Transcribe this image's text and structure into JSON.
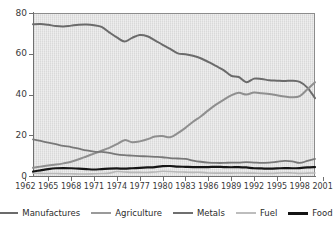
{
  "chart_data": {
    "type": "line",
    "title": "",
    "subtitle": "",
    "xlabel": "",
    "ylabel": "",
    "xlim": [
      1963,
      2000
    ],
    "ylim": [
      0,
      80
    ],
    "yticks": [
      0,
      20,
      40,
      60,
      80
    ],
    "xticks": [
      1962,
      1965,
      1968,
      1971,
      1974,
      1977,
      1980,
      1983,
      1986,
      1989,
      1992,
      1995,
      1998,
      2001
    ],
    "grid": false,
    "legend_position": "bottom",
    "x": [
      1963,
      1964,
      1965,
      1966,
      1967,
      1968,
      1969,
      1970,
      1971,
      1972,
      1973,
      1974,
      1975,
      1976,
      1977,
      1978,
      1979,
      1980,
      1981,
      1982,
      1983,
      1984,
      1985,
      1986,
      1987,
      1988,
      1989,
      1990,
      1991,
      1992,
      1993,
      1994,
      1995,
      1996,
      1997,
      1998,
      1999,
      2000
    ],
    "series": [
      {
        "name": "Manufactures",
        "color": "#6b6b6b",
        "width": 2.0,
        "values": [
          74.5,
          74.6,
          74.2,
          73.6,
          73.4,
          73.8,
          74.2,
          74.3,
          74.0,
          73.2,
          70.5,
          68.0,
          66.0,
          67.8,
          69.2,
          68.6,
          66.6,
          64.4,
          62.4,
          60.2,
          59.8,
          59.0,
          57.8,
          56.0,
          54.0,
          52.0,
          49.2,
          48.6,
          46.0,
          47.8,
          47.6,
          47.0,
          46.8,
          46.6,
          46.8,
          46.2,
          43.4,
          38.2
        ]
      },
      {
        "name": "Agriculture",
        "color": "#8f8f8f",
        "width": 2.0,
        "values": [
          4.0,
          4.6,
          5.2,
          5.6,
          6.2,
          7.0,
          8.2,
          9.6,
          11.0,
          12.4,
          13.8,
          15.6,
          17.6,
          16.6,
          17.0,
          18.0,
          19.4,
          19.6,
          19.0,
          21.0,
          23.6,
          26.6,
          29.2,
          32.2,
          35.0,
          37.4,
          39.6,
          40.8,
          40.0,
          41.0,
          40.6,
          40.2,
          39.6,
          39.0,
          38.6,
          39.2,
          42.6,
          46.0
        ]
      },
      {
        "name": "Metals",
        "color": "#787878",
        "width": 1.8,
        "values": [
          18.0,
          17.2,
          16.4,
          15.6,
          14.8,
          14.2,
          13.4,
          12.6,
          12.0,
          11.8,
          11.4,
          10.6,
          10.2,
          10.0,
          9.8,
          9.6,
          9.4,
          9.2,
          8.8,
          8.6,
          8.4,
          7.6,
          7.0,
          6.6,
          6.4,
          6.4,
          6.6,
          6.6,
          6.8,
          6.6,
          6.4,
          6.6,
          7.0,
          7.4,
          7.2,
          6.4,
          7.4,
          8.4
        ]
      },
      {
        "name": "Fuel",
        "color": "#b8b8b8",
        "width": 1.6,
        "values": [
          1.4,
          1.3,
          1.2,
          1.2,
          1.1,
          1.1,
          1.0,
          1.0,
          1.1,
          1.2,
          1.4,
          2.2,
          2.0,
          1.8,
          1.8,
          1.7,
          2.0,
          2.3,
          2.2,
          2.0,
          1.9,
          1.8,
          1.8,
          1.5,
          1.4,
          1.4,
          1.4,
          1.5,
          1.4,
          1.4,
          1.3,
          1.3,
          1.4,
          1.6,
          1.5,
          1.3,
          1.4,
          1.5
        ]
      },
      {
        "name": "Food",
        "color": "#151515",
        "width": 2.2,
        "values": [
          2.2,
          2.8,
          3.4,
          3.8,
          3.9,
          3.8,
          3.6,
          3.4,
          3.2,
          3.4,
          3.6,
          3.7,
          3.6,
          3.8,
          4.0,
          4.2,
          4.4,
          4.8,
          4.9,
          4.6,
          4.5,
          4.4,
          4.4,
          4.4,
          4.5,
          4.4,
          4.3,
          4.4,
          4.2,
          3.8,
          3.7,
          3.6,
          3.7,
          3.9,
          3.8,
          3.9,
          4.2,
          4.4
        ]
      }
    ]
  },
  "yaxis": {
    "labels": [
      "80",
      "60",
      "40",
      "20",
      "0"
    ]
  },
  "xaxis": {
    "labels": [
      "1962",
      "1965",
      "1968",
      "1971",
      "1974",
      "1977",
      "1980",
      "1983",
      "1986",
      "1989",
      "1992",
      "1995",
      "1998",
      "2001"
    ]
  },
  "legend": {
    "items": [
      {
        "label": "Manufactures",
        "color": "#6b6b6b",
        "thickness": "2.6px"
      },
      {
        "label": "Agriculture",
        "color": "#9a9a9a",
        "thickness": "2.6px"
      },
      {
        "label": "Metals",
        "color": "#6f6f6f",
        "thickness": "2.6px"
      },
      {
        "label": "Fuel",
        "color": "#bdbdbd",
        "thickness": "2.2px"
      },
      {
        "label": "Food",
        "color": "#141414",
        "thickness": "3px"
      }
    ]
  }
}
